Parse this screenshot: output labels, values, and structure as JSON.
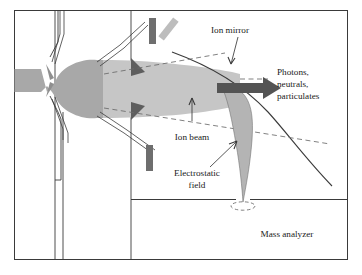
{
  "figure": {
    "title_visible": false,
    "background_color": "#ffffff",
    "frame": {
      "stroke_color": "#3a3a3a",
      "fill_color": "#ffffff"
    },
    "palette": {
      "outline": "#3a3a3a",
      "beam_gray": "#a8a8a8",
      "beam_light_gray": "#c6c6c6",
      "electrode_dark": "#6e6e6e",
      "electrode_light": "#bdbdbd",
      "arrow_dark": "#545454",
      "dashed_line": "#6a6a6a",
      "text": "#1a1a1a"
    },
    "labels": {
      "ion_mirror": "Ion mirror",
      "photons_line1": "Photons,",
      "photons_line2": "neutrals,",
      "photons_line3": "particulates",
      "ion_beam": "Ion beam",
      "electrostatic_line1": "Electrostatic",
      "electrostatic_line2": "field",
      "mass_analyzer": "Mass analyzer"
    },
    "components": [
      {
        "name": "sample-inlet-capillary",
        "description": "narrow inlet channel at far left"
      },
      {
        "name": "expansion-chamber",
        "description": "bulb-shaped gray expansion region"
      },
      {
        "name": "skimmer-cone-upper",
        "description": "upper dark skimmer cone"
      },
      {
        "name": "skimmer-cone-lower",
        "description": "lower dark skimmer cone"
      },
      {
        "name": "electrode-bar-upper",
        "description": "dark vertical electrode bar, upper"
      },
      {
        "name": "electrode-bar-tilted",
        "description": "light tilted electrode bar, upper"
      },
      {
        "name": "electrode-bar-lower",
        "description": "dark vertical electrode bar, lower"
      },
      {
        "name": "ion-mirror-curve",
        "description": "solid curved ion mirror surface"
      },
      {
        "name": "deflected-ion-beam",
        "description": "gray beam curving down into analyzer"
      },
      {
        "name": "photon-arrow",
        "description": "thick dark arrow exiting to the right"
      },
      {
        "name": "focal-ellipse",
        "description": "dashed ellipse at analyzer entrance"
      },
      {
        "name": "chamber-divider",
        "description": "horizontal wall above mass analyzer"
      }
    ]
  }
}
